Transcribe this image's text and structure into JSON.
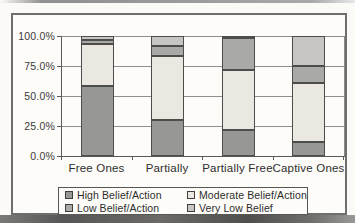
{
  "chart_data": {
    "type": "bar",
    "stacked": true,
    "title": "",
    "xlabel": "",
    "ylabel": "",
    "categories": [
      "Free Ones",
      "Partially",
      "Partially Free",
      "Captive Ones"
    ],
    "series": [
      {
        "name": "High Belief/Action",
        "color": "#979795",
        "pattern": "solid",
        "values": [
          58,
          30,
          22,
          12
        ]
      },
      {
        "name": "Moderate Belief/Action",
        "color": "#eae8e1",
        "pattern": "dots",
        "values": [
          35,
          53,
          50,
          49
        ]
      },
      {
        "name": "Low Belief/Action",
        "color": "#a9a9a7",
        "pattern": "solid",
        "values": [
          4,
          9,
          26,
          14
        ]
      },
      {
        "name": "Very Low Belief",
        "color": "#c8c6c2",
        "pattern": "solid",
        "values": [
          3,
          8,
          2,
          25
        ]
      }
    ],
    "ylim": [
      0,
      100
    ],
    "y_ticks": [
      {
        "value": 100,
        "label": "100.0%"
      },
      {
        "value": 75,
        "label": "75.0%"
      },
      {
        "value": 50,
        "label": "50.0%"
      },
      {
        "value": 25,
        "label": "25.0%"
      },
      {
        "value": 0,
        "label": "0.0%"
      }
    ],
    "grid": true,
    "legend_position": "bottom",
    "legend_order": [
      "High Belief/Action",
      "Moderate Belief/Action",
      "Low Belief/Action",
      "Very Low Belief"
    ]
  },
  "colors": {
    "frame_border": "#6e6e6c",
    "axis_line": "#58585a",
    "gridline": "#8f8f8d",
    "paper": "#fdfcf8",
    "segment_border": "#4d4d4b"
  }
}
